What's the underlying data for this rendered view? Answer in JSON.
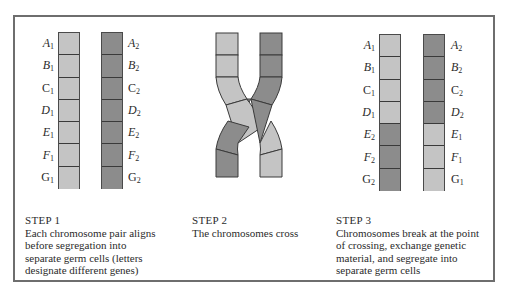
{
  "colors": {
    "light": "#c4c4c4",
    "dark": "#8c8c8c",
    "border": "#6e6e6e",
    "outline": "#3a3a3a"
  },
  "steps": [
    {
      "title": "STEP 1",
      "lines": [
        "Each chromosome pair aligns",
        "before segregation into",
        "separate germ cells (letters",
        "designate different genes)"
      ],
      "left_chromosome": {
        "labels": [
          "A1",
          "B1",
          "C1",
          "D1",
          "E1",
          "F1",
          "G1"
        ],
        "shades": [
          "light",
          "light",
          "light",
          "light",
          "light",
          "light",
          "light"
        ]
      },
      "right_chromosome": {
        "labels": [
          "A2",
          "B2",
          "C2",
          "D2",
          "E2",
          "F2",
          "G2"
        ],
        "shades": [
          "dark",
          "dark",
          "dark",
          "dark",
          "dark",
          "dark",
          "dark"
        ]
      }
    },
    {
      "title": "STEP 2",
      "lines": [
        "The chromosomes cross"
      ]
    },
    {
      "title": "STEP 3",
      "lines": [
        "Chromosomes break at the point",
        "of crossing, exchange genetic",
        "material, and segregate into",
        "separate germ cells"
      ],
      "left_chromosome": {
        "labels": [
          "A1",
          "B1",
          "C1",
          "D1",
          "E2",
          "F2",
          "G2"
        ],
        "shades": [
          "light",
          "light",
          "light",
          "light",
          "dark",
          "dark",
          "dark"
        ]
      },
      "right_chromosome": {
        "labels": [
          "A2",
          "B2",
          "C2",
          "D2",
          "E1",
          "F1",
          "G1"
        ],
        "shades": [
          "dark",
          "dark",
          "dark",
          "dark",
          "light",
          "light",
          "light"
        ]
      }
    }
  ]
}
